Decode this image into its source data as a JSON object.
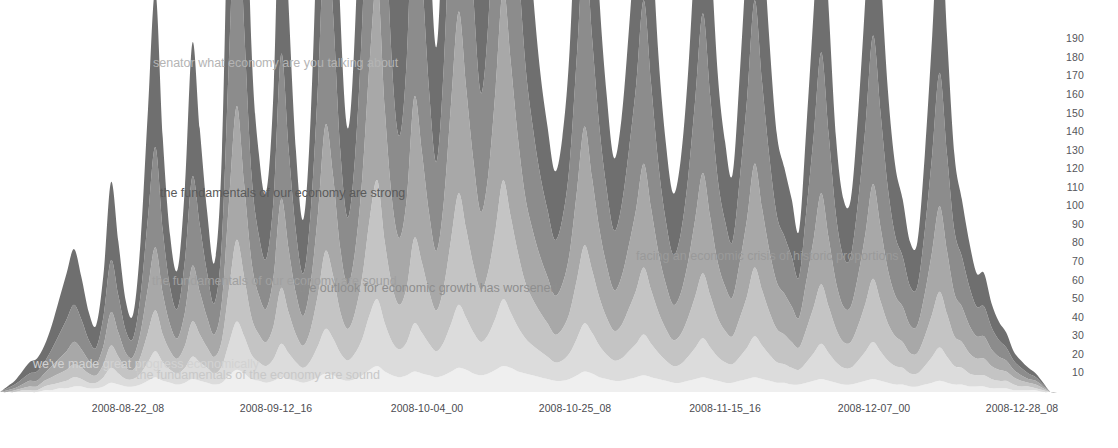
{
  "chart_data": {
    "type": "area",
    "subtype": "themeriver-streamgraph",
    "title": "",
    "xlabel": "",
    "ylabel": "",
    "grid": false,
    "legend_position": "none",
    "background_color": "#ffffff",
    "axis_text_color": "#55555a",
    "y_axis": {
      "ticks": [
        190,
        180,
        170,
        160,
        150,
        140,
        130,
        120,
        110,
        100,
        90,
        80,
        70,
        60,
        50,
        40,
        30,
        20,
        10
      ],
      "ylim": [
        0,
        195
      ],
      "side": "right"
    },
    "x_axis": {
      "tick_labels": [
        "2008-08-22_08",
        "2008-09-12_16",
        "2008-10-04_00",
        "2008-10-25_08",
        "2008-11-15_16",
        "2008-12-07_00",
        "2008-12-28_08"
      ],
      "tick_positions": [
        128,
        276,
        427,
        575,
        725,
        874,
        1022
      ],
      "xlim": [
        0,
        1058
      ]
    },
    "layer_colors": [
      "#efefef",
      "#dcdcdc",
      "#c4c4c4",
      "#a8a8a8",
      "#8c8c8c",
      "#6f6f6f"
    ],
    "series": [
      {
        "name": "layer-1",
        "color": "#efefef",
        "values": [
          0,
          0,
          0,
          0,
          0,
          0,
          1,
          1,
          2,
          2,
          3,
          3,
          2,
          2,
          3,
          5,
          4,
          3,
          3,
          4,
          6,
          8,
          6,
          5,
          4,
          5,
          7,
          6,
          5,
          4,
          5,
          9,
          12,
          10,
          7,
          6,
          5,
          6,
          8,
          7,
          6,
          5,
          6,
          8,
          10,
          9,
          7,
          6,
          7,
          9,
          12,
          14,
          11,
          9,
          8,
          9,
          11,
          10,
          9,
          8,
          9,
          11,
          13,
          12,
          10,
          9,
          10,
          12,
          14,
          13,
          11,
          10,
          9,
          8,
          7,
          6,
          6,
          7,
          9,
          11,
          10,
          8,
          7,
          6,
          6,
          7,
          8,
          9,
          8,
          7,
          6,
          5,
          5,
          6,
          7,
          8,
          7,
          6,
          5,
          5,
          6,
          7,
          8,
          7,
          6,
          5,
          5,
          4,
          4,
          5,
          6,
          7,
          6,
          5,
          4,
          4,
          5,
          6,
          7,
          6,
          5,
          4,
          4,
          3,
          3,
          4,
          5,
          6,
          5,
          4,
          4,
          3,
          3,
          3,
          2,
          2,
          2,
          1,
          1,
          1,
          1,
          0,
          0,
          0
        ]
      },
      {
        "name": "layer-2",
        "color": "#dcdcdc",
        "values": [
          0,
          0,
          0,
          1,
          1,
          1,
          2,
          3,
          3,
          4,
          5,
          4,
          3,
          3,
          5,
          8,
          6,
          4,
          4,
          6,
          10,
          14,
          10,
          7,
          6,
          8,
          12,
          10,
          8,
          6,
          9,
          18,
          26,
          20,
          13,
          10,
          9,
          12,
          18,
          14,
          10,
          8,
          11,
          17,
          24,
          20,
          14,
          11,
          14,
          20,
          30,
          36,
          26,
          18,
          15,
          18,
          26,
          22,
          17,
          14,
          18,
          26,
          34,
          28,
          22,
          18,
          21,
          28,
          36,
          30,
          24,
          19,
          16,
          14,
          12,
          10,
          11,
          14,
          20,
          26,
          22,
          17,
          13,
          11,
          12,
          15,
          18,
          22,
          18,
          14,
          11,
          9,
          10,
          13,
          17,
          21,
          17,
          13,
          11,
          10,
          13,
          17,
          22,
          18,
          14,
          11,
          10,
          9,
          8,
          11,
          15,
          19,
          15,
          11,
          9,
          9,
          12,
          16,
          20,
          16,
          12,
          10,
          9,
          7,
          7,
          10,
          14,
          18,
          14,
          10,
          9,
          7,
          6,
          6,
          5,
          4,
          4,
          3,
          2,
          2,
          1,
          1,
          0,
          0
        ]
      },
      {
        "name": "layer-3",
        "color": "#c4c4c4",
        "values": [
          0,
          0,
          1,
          1,
          2,
          2,
          3,
          4,
          5,
          6,
          7,
          6,
          5,
          4,
          7,
          12,
          9,
          6,
          5,
          9,
          16,
          22,
          15,
          10,
          8,
          12,
          19,
          15,
          11,
          9,
          14,
          30,
          44,
          32,
          20,
          15,
          13,
          18,
          30,
          22,
          15,
          12,
          17,
          28,
          42,
          34,
          22,
          17,
          22,
          34,
          52,
          64,
          44,
          30,
          24,
          30,
          46,
          38,
          28,
          22,
          30,
          46,
          60,
          48,
          36,
          28,
          34,
          48,
          64,
          52,
          40,
          30,
          25,
          21,
          18,
          15,
          17,
          22,
          32,
          42,
          34,
          26,
          20,
          16,
          18,
          23,
          29,
          36,
          29,
          22,
          17,
          14,
          16,
          21,
          28,
          35,
          28,
          21,
          17,
          15,
          21,
          28,
          37,
          30,
          23,
          18,
          16,
          14,
          12,
          18,
          25,
          32,
          25,
          18,
          14,
          14,
          19,
          26,
          34,
          27,
          20,
          16,
          14,
          11,
          11,
          16,
          23,
          30,
          23,
          16,
          14,
          11,
          9,
          9,
          7,
          6,
          5,
          4,
          3,
          2,
          2,
          1,
          0,
          0
        ]
      },
      {
        "name": "layer-4",
        "color": "#a8a8a8",
        "values": [
          0,
          1,
          1,
          2,
          3,
          3,
          4,
          6,
          8,
          10,
          12,
          10,
          7,
          6,
          10,
          18,
          13,
          8,
          7,
          13,
          24,
          34,
          22,
          14,
          11,
          18,
          30,
          23,
          16,
          12,
          21,
          48,
          72,
          50,
          30,
          21,
          18,
          27,
          48,
          34,
          22,
          16,
          25,
          44,
          68,
          54,
          34,
          24,
          33,
          54,
          86,
          108,
          72,
          46,
          36,
          48,
          76,
          60,
          42,
          32,
          46,
          74,
          98,
          76,
          56,
          42,
          52,
          76,
          104,
          84,
          62,
          46,
          37,
          30,
          25,
          21,
          24,
          32,
          48,
          64,
          50,
          37,
          28,
          22,
          26,
          34,
          44,
          56,
          44,
          32,
          24,
          19,
          22,
          30,
          42,
          54,
          42,
          30,
          24,
          21,
          30,
          42,
          56,
          44,
          33,
          25,
          22,
          19,
          16,
          26,
          37,
          49,
          37,
          25,
          19,
          19,
          27,
          38,
          51,
          40,
          29,
          22,
          19,
          15,
          15,
          23,
          34,
          46,
          34,
          23,
          19,
          15,
          12,
          12,
          9,
          7,
          6,
          4,
          3,
          2,
          2,
          1,
          0,
          0
        ]
      },
      {
        "name": "layer-5",
        "color": "#8c8c8c",
        "values": [
          0,
          1,
          2,
          3,
          4,
          5,
          6,
          9,
          13,
          17,
          20,
          16,
          11,
          9,
          16,
          28,
          20,
          12,
          10,
          20,
          38,
          54,
          34,
          20,
          16,
          28,
          48,
          36,
          24,
          17,
          33,
          80,
          124,
          84,
          47,
          32,
          27,
          42,
          78,
          54,
          33,
          23,
          38,
          70,
          112,
          88,
          53,
          36,
          51,
          86,
          142,
          182,
          118,
          72,
          55,
          76,
          126,
          98,
          66,
          48,
          74,
          122,
          164,
          124,
          88,
          64,
          82,
          124,
          172,
          138,
          100,
          72,
          56,
          44,
          36,
          30,
          35,
          48,
          74,
          100,
          76,
          55,
          41,
          32,
          38,
          51,
          67,
          88,
          67,
          47,
          34,
          27,
          32,
          45,
          65,
          86,
          65,
          45,
          35,
          30,
          45,
          65,
          88,
          68,
          50,
          36,
          31,
          27,
          22,
          38,
          56,
          76,
          56,
          36,
          27,
          27,
          40,
          58,
          80,
          62,
          44,
          32,
          27,
          21,
          21,
          34,
          52,
          72,
          52,
          34,
          27,
          21,
          16,
          16,
          12,
          9,
          7,
          5,
          4,
          3,
          2,
          1,
          0,
          0
        ]
      },
      {
        "name": "layer-6",
        "color": "#6f6f6f",
        "values": [
          0,
          1,
          2,
          4,
          6,
          7,
          9,
          13,
          19,
          25,
          30,
          23,
          15,
          12,
          23,
          42,
          29,
          16,
          13,
          29,
          58,
          84,
          50,
          28,
          21,
          40,
          72,
          52,
          33,
          22,
          48,
          124,
          196,
          130,
          68,
          44,
          36,
          60,
          118,
          78,
          44,
          29,
          52,
          102,
          168,
          130,
          74,
          48,
          70,
          124,
          210,
          272,
          172,
          100,
          74,
          106,
          182,
          140,
          90,
          62,
          102,
          174,
          238,
          176,
          122,
          86,
          114,
          176,
          248,
          198,
          140,
          98,
          74,
          56,
          45,
          37,
          44,
          62,
          98,
          134,
          100,
          70,
          51,
          39,
          47,
          65,
          87,
          116,
          87,
          59,
          42,
          33,
          40,
          57,
          84,
          112,
          84,
          57,
          43,
          36,
          57,
          84,
          116,
          88,
          63,
          44,
          37,
          31,
          25,
          45,
          68,
          94,
          68,
          42,
          31,
          31,
          48,
          71,
          100,
          77,
          53,
          38,
          31,
          24,
          24,
          41,
          64,
          90,
          64,
          41,
          31,
          24,
          18,
          18,
          13,
          10,
          8,
          5,
          4,
          3,
          2,
          1,
          0,
          0
        ]
      }
    ],
    "annotations": [
      {
        "id": "annotation-senator-what-economy",
        "text": "senator what economy are you talking about",
        "x": 153,
        "y": 56,
        "color": "#b4b4b4",
        "font_size": 12.5
      },
      {
        "id": "annotation-fundamentals-strong",
        "text": "the fundamentals of our economy are strong",
        "x": 160,
        "y": 186,
        "color": "#5a5a5a",
        "font_size": 12.5
      },
      {
        "id": "annotation-fundamentals-sound-upper",
        "text": "the fundamentals of our economy are sound",
        "x": 152,
        "y": 274,
        "color": "#a0a0a0",
        "font_size": 12.5
      },
      {
        "id": "annotation-outlook-worsened",
        "text": "the outlook for economic growth has worsened",
        "x": 299,
        "y": 281,
        "color": "#8e8e8e",
        "font_size": 12.5
      },
      {
        "id": "annotation-economic-crisis",
        "text": "facing an economic crisis of historic proportions",
        "x": 636,
        "y": 249,
        "color": "#9a9a9a",
        "font_size": 12.5
      },
      {
        "id": "annotation-great-progress",
        "text": "we've made great progress economically",
        "x": 33,
        "y": 357,
        "color": "#d2d2d2",
        "font_size": 12.5
      },
      {
        "id": "annotation-fundamentals-sound-lower",
        "text": "the fundamentals of the economy are sound",
        "x": 136,
        "y": 368,
        "color": "#c8c8c8",
        "font_size": 12.5
      }
    ]
  }
}
